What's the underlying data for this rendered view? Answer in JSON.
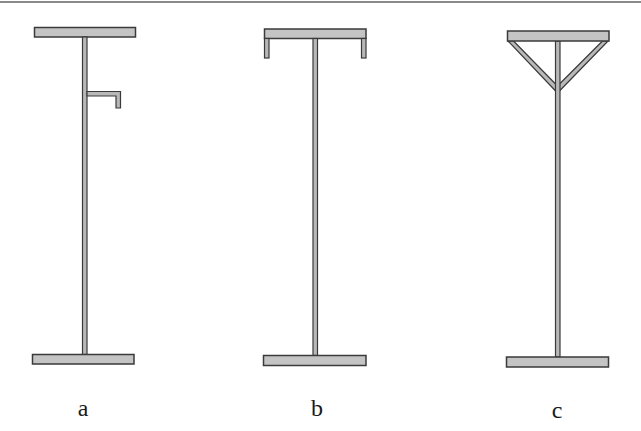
{
  "figure": {
    "colors": {
      "flange_fill": "#c4c4c4",
      "outline": "#3a3a3a",
      "web_fill": "#b8b8b8",
      "top_rule": "#8a8a8a",
      "background": "#ffffff"
    },
    "panels": [
      {
        "id": "a",
        "label": "a",
        "description": "I-section column with a small L-shaped bracket attached to the web near the top"
      },
      {
        "id": "b",
        "label": "b",
        "description": "I-section column whose top flange has downturned lips at both ends"
      },
      {
        "id": "c",
        "label": "c",
        "description": "I-section column with diagonal braces from the ends of the top flange to the web"
      }
    ]
  }
}
